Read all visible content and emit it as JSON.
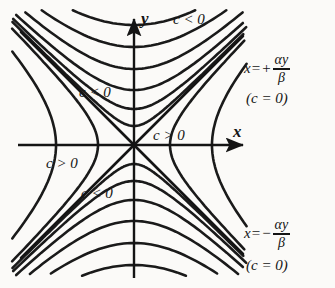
{
  "figure": {
    "background_color": "#fbfaf8",
    "curve_color": "#1a1a1a",
    "axis_color": "#141414"
  },
  "axes": {
    "x_label": "x",
    "y_label": "y",
    "origin": [
      134,
      145
    ],
    "x_axis_start": [
      18,
      145
    ],
    "x_axis_end": [
      248,
      145
    ],
    "y_axis_top": [
      134,
      14
    ],
    "y_axis_bottom": [
      134,
      278
    ]
  },
  "labels": {
    "c_negative_top": "c < 0",
    "c_negative_upper_left": "c < 0",
    "c_positive_right": "c > 0",
    "c_positive_left": "c > 0",
    "c_negative_lower": "c < 0",
    "asymptote_upper": {
      "lhs": "x",
      "equals": "=",
      "sign": "+",
      "numerator": "αy",
      "denominator": "β",
      "note": "(c = 0)"
    },
    "asymptote_lower": {
      "lhs": "x",
      "equals": "=",
      "sign": "−",
      "numerator": "αy",
      "denominator": "β",
      "note": "(c = 0)"
    }
  },
  "chart_data": {
    "type": "line",
    "title": "",
    "xlabel": "x",
    "ylabel": "y",
    "grid": false,
    "legend": "none",
    "xlim": [
      -134,
      201
    ],
    "ylim": [
      -143,
      131
    ],
    "asymptote_slopes": [
      1.0,
      -1.0
    ],
    "series": [
      {
        "name": "c<0 branch 1 (opens up)",
        "sign": "c<0",
        "orientation": "up",
        "vertex": [
          134,
          120
        ],
        "a": 120
      },
      {
        "name": "c<0 branch 2 (opens up)",
        "sign": "c<0",
        "orientation": "up",
        "vertex": [
          134,
          98
        ],
        "a": 98
      },
      {
        "name": "c<0 branch 3 (opens up)",
        "sign": "c<0",
        "orientation": "up",
        "vertex": [
          134,
          76
        ],
        "a": 76
      },
      {
        "name": "c<0 branch 4 (opens up)",
        "sign": "c<0",
        "orientation": "up",
        "vertex": [
          134,
          55
        ],
        "a": 55
      },
      {
        "name": "c<0 branch 5 (opens up)",
        "sign": "c<0",
        "orientation": "up",
        "vertex": [
          134,
          36
        ],
        "a": 36
      },
      {
        "name": "c<0 branch 6 (opens up)",
        "sign": "c<0",
        "orientation": "up",
        "vertex": [
          134,
          19
        ],
        "a": 19
      },
      {
        "name": "c<0 branch 1 (opens down)",
        "sign": "c<0",
        "orientation": "down",
        "vertex": [
          134,
          -120
        ],
        "a": 120
      },
      {
        "name": "c<0 branch 2 (opens down)",
        "sign": "c<0",
        "orientation": "down",
        "vertex": [
          134,
          -98
        ],
        "a": 98
      },
      {
        "name": "c<0 branch 3 (opens down)",
        "sign": "c<0",
        "orientation": "down",
        "vertex": [
          134,
          -76
        ],
        "a": 76
      },
      {
        "name": "c<0 branch 4 (opens down)",
        "sign": "c<0",
        "orientation": "down",
        "vertex": [
          134,
          -55
        ],
        "a": 55
      },
      {
        "name": "c<0 branch 5 (opens down)",
        "sign": "c<0",
        "orientation": "down",
        "vertex": [
          134,
          -36
        ],
        "a": 36
      },
      {
        "name": "c<0 branch 6 (opens down)",
        "sign": "c<0",
        "orientation": "down",
        "vertex": [
          134,
          -19
        ],
        "a": 19
      },
      {
        "name": "c>0 branch 1 (opens right)",
        "sign": "c>0",
        "orientation": "right",
        "vertex": [
          36,
          145
        ],
        "a": 36
      },
      {
        "name": "c>0 branch 2 (opens right)",
        "sign": "c>0",
        "orientation": "right",
        "vertex": [
          78,
          145
        ],
        "a": 78
      },
      {
        "name": "c>0 branch 1 (opens left)",
        "sign": "c>0",
        "orientation": "left",
        "vertex": [
          -36,
          145
        ],
        "a": 36
      },
      {
        "name": "c>0 branch 2 (opens left)",
        "sign": "c>0",
        "orientation": "left",
        "vertex": [
          -78,
          145
        ],
        "a": 78
      }
    ]
  }
}
